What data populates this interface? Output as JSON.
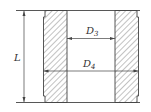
{
  "diagram": {
    "type": "cross-section",
    "colors": {
      "line": "#444444",
      "hatch": "#666666",
      "background": "#ffffff"
    },
    "dimensions": [
      {
        "id": "L",
        "label": "L",
        "sub": "",
        "orientation": "vertical"
      },
      {
        "id": "D3",
        "label": "D",
        "sub": "3",
        "orientation": "horizontal",
        "measures": "inner diameter"
      },
      {
        "id": "D4",
        "label": "D",
        "sub": "4",
        "orientation": "horizontal",
        "measures": "outer diameter"
      }
    ]
  }
}
